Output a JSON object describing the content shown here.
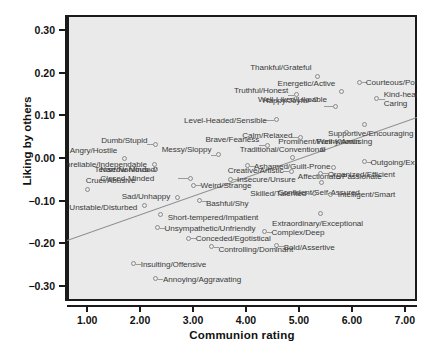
{
  "chart_data": {
    "type": "scatter",
    "title": "",
    "xlabel": "Communion rating",
    "ylabel": "Liking by others",
    "xlim": [
      0.62,
      7.23
    ],
    "ylim": [
      -0.335,
      0.335
    ],
    "xticks": [
      "1.00",
      "2.00",
      "3.00",
      "4.00",
      "5.00",
      "6.00",
      "7.00"
    ],
    "xtick_values": [
      1.0,
      2.0,
      3.0,
      4.0,
      5.0,
      6.0,
      7.0
    ],
    "yticks": [
      "0.30",
      "0.20",
      "0.10",
      "0.00",
      "−0.10",
      "−0.20",
      "−0.30"
    ],
    "ytick_values": [
      0.3,
      0.2,
      0.1,
      0.0,
      -0.1,
      -0.2,
      -0.3
    ],
    "grid": false,
    "legend": null,
    "panel_background": "#eaeaea",
    "marker_color": "#8a8a8a",
    "trendline": {
      "visible": true,
      "color": "#8d8d8d",
      "x_start": 0.62,
      "y_start": -0.193,
      "x_end": 7.23,
      "y_end": 0.095
    },
    "points": [
      {
        "label": "Thankful/Grateful",
        "x": 5.35,
        "y": 0.191
      },
      {
        "label": "Courteous/Polite",
        "x": 6.15,
        "y": 0.178
      },
      {
        "label": "Energetic/Active",
        "x": 5.8,
        "y": 0.155
      },
      {
        "label": "Truthful/Honest",
        "x": 4.95,
        "y": 0.148
      },
      {
        "label": "Kind-hearted/Caring",
        "x": 6.47,
        "y": 0.139
      },
      {
        "label": "Happy/Joyful",
        "x": 5.32,
        "y": 0.137
      },
      {
        "label": "Well-Liked/Likeable",
        "x": 5.7,
        "y": 0.121
      },
      {
        "label": "Level-Headed/Sensible",
        "x": 4.58,
        "y": 0.09
      },
      {
        "label": "Supportive/Encouraging",
        "x": 6.23,
        "y": 0.078
      },
      {
        "label": "Funny/Amusing",
        "x": 5.9,
        "y": 0.06
      },
      {
        "label": "Calm/Relaxed",
        "x": 5.03,
        "y": 0.049
      },
      {
        "label": "Dumb/Stupid",
        "x": 2.29,
        "y": 0.032
      },
      {
        "label": "Brave/Fearless",
        "x": 4.4,
        "y": 0.03
      },
      {
        "label": "Prominent/Well-Known",
        "x": 5.44,
        "y": 0.021
      },
      {
        "label": "Messy/Sloppy",
        "x": 3.48,
        "y": 0.008
      },
      {
        "label": "Traditional/Conventional",
        "x": 4.88,
        "y": 0.002
      },
      {
        "label": "Angry/Hostile",
        "x": 1.7,
        "y": -0.001
      },
      {
        "label": "Outgoing/Extraverted",
        "x": 6.24,
        "y": -0.009
      },
      {
        "label": "Unreliable/Independable",
        "x": 2.28,
        "y": -0.016
      },
      {
        "label": "Ashamed/Guilt-Prone",
        "x": 4.02,
        "y": -0.018
      },
      {
        "label": "Affectionate/Passionate",
        "x": 5.66,
        "y": -0.022
      },
      {
        "label": "Tense/Nervous",
        "x": 2.3,
        "y": -0.028
      },
      {
        "label": "Creative/Artistic",
        "x": 4.86,
        "y": -0.031
      },
      {
        "label": "Organized/Efficient",
        "x": 5.41,
        "y": -0.036
      },
      {
        "label": "Narrow-Minded/Closed-Minded",
        "x": 2.95,
        "y": -0.047
      },
      {
        "label": "Insecure/Unsure",
        "x": 3.7,
        "y": -0.05
      },
      {
        "label": "Confident/Self-Assured",
        "x": 5.43,
        "y": -0.058
      },
      {
        "label": "Weird/Strange",
        "x": 3.01,
        "y": -0.064
      },
      {
        "label": "Cruel/Abusive",
        "x": 1.01,
        "y": -0.073
      },
      {
        "label": "Skilled/Talented",
        "x": 5.29,
        "y": -0.083
      },
      {
        "label": "Intelligent/Smart",
        "x": 5.6,
        "y": -0.085
      },
      {
        "label": "Sad/Unhappy",
        "x": 2.7,
        "y": -0.092
      },
      {
        "label": "Bashful/Shy",
        "x": 3.13,
        "y": -0.1
      },
      {
        "label": "Unstable/Disturbed",
        "x": 2.08,
        "y": -0.112
      },
      {
        "label": "Extraordinary/Exceptional",
        "x": 5.4,
        "y": -0.13
      },
      {
        "label": "Short-tempered/Impatient",
        "x": 2.39,
        "y": -0.133
      },
      {
        "label": "Unsympathetic/Unfriendly",
        "x": 2.33,
        "y": -0.163
      },
      {
        "label": "Complex/Deep",
        "x": 4.35,
        "y": -0.173
      },
      {
        "label": "Conceded/Egotistical",
        "x": 2.92,
        "y": -0.188
      },
      {
        "label": "Bold/Assertive",
        "x": 4.58,
        "y": -0.205
      },
      {
        "label": "Controlling/Dominant",
        "x": 3.35,
        "y": -0.208
      },
      {
        "label": "Insulting/Offensive",
        "x": 1.88,
        "y": -0.248
      },
      {
        "label": "Annoying/Aggravating",
        "x": 2.3,
        "y": -0.283
      }
    ],
    "label_placements": [
      {
        "label": "Thankful/Grateful",
        "side": "r",
        "dx": -6,
        "dy": -9,
        "lead": false
      },
      {
        "label": "Courteous/Polite",
        "side": "l",
        "dx": 6,
        "dy": 0,
        "lead": true,
        "len": 5
      },
      {
        "label": "Energetic/Active",
        "side": "r",
        "dx": -6,
        "dy": -9,
        "lead": false
      },
      {
        "label": "Truthful/Honest",
        "side": "r",
        "dx": -8,
        "dy": -5,
        "lead": true,
        "len": 6
      },
      {
        "label": "Kind-hearted/Caring",
        "side": "l",
        "dx": 7,
        "dy": 0,
        "lead": true,
        "len": 6,
        "two": true
      },
      {
        "label": "Happy/Joyful",
        "side": "r",
        "dx": -7,
        "dy": 0,
        "lead": true,
        "len": 5
      },
      {
        "label": "Well-Liked/Likeable",
        "side": "r",
        "dx": -9,
        "dy": -7,
        "lead": true,
        "len": 9
      },
      {
        "label": "Level-Headed/Sensible",
        "side": "r",
        "dx": -10,
        "dy": 0,
        "lead": true,
        "len": 10
      },
      {
        "label": "Supportive/Encouraging",
        "side": "l",
        "dx": -36,
        "dy": 8,
        "lead": false
      },
      {
        "label": "Funny/Amusing",
        "side": "l",
        "dx": -30,
        "dy": 9,
        "lead": false
      },
      {
        "label": "Calm/Relaxed",
        "side": "r",
        "dx": -8,
        "dy": -2,
        "lead": true,
        "len": 6
      },
      {
        "label": "Dumb/Stupid",
        "side": "r",
        "dx": -8,
        "dy": -4,
        "lead": true,
        "len": 6
      },
      {
        "label": "Brave/Fearless",
        "side": "r",
        "dx": -8,
        "dy": -6,
        "lead": true,
        "len": 6
      },
      {
        "label": "Prominent/Well-Known",
        "side": "l",
        "dx": -44,
        "dy": -8,
        "lead": false
      },
      {
        "label": "Messy/Sloppy",
        "side": "r",
        "dx": -7,
        "dy": -6,
        "lead": true,
        "len": 5
      },
      {
        "label": "Traditional/Conventional",
        "side": "c",
        "dx": -10,
        "dy": -8,
        "lead": false
      },
      {
        "label": "Angry/Hostile",
        "side": "r",
        "dx": -7,
        "dy": -8,
        "lead": false
      },
      {
        "label": "Outgoing/Extraverted",
        "side": "l",
        "dx": 6,
        "dy": 0,
        "lead": true,
        "len": 5
      },
      {
        "label": "Unreliable/Independable",
        "side": "r",
        "dx": -8,
        "dy": -1,
        "lead": false
      },
      {
        "label": "Ashamed/Guilt-Prone",
        "side": "l",
        "dx": 7,
        "dy": 0,
        "lead": true,
        "len": 6
      },
      {
        "label": "Affectionate/Passionate",
        "side": "l",
        "dx": -36,
        "dy": 9,
        "lead": false
      },
      {
        "label": "Tense/Nervous",
        "side": "r",
        "dx": -8,
        "dy": -1,
        "lead": true,
        "len": 6
      },
      {
        "label": "Creative/Artistic",
        "side": "r",
        "dx": -8,
        "dy": -1,
        "lead": true,
        "len": 6
      },
      {
        "label": "Organized/Efficient",
        "side": "l",
        "dx": 7,
        "dy": 1,
        "lead": true,
        "len": 5
      },
      {
        "label": "Narrow-Minded/Closed-Minded",
        "side": "r",
        "dx": -12,
        "dy": -4,
        "lead": true,
        "len": 10,
        "two": true
      },
      {
        "label": "Insecure/Unsure",
        "side": "l",
        "dx": 7,
        "dy": 0,
        "lead": true,
        "len": 5
      },
      {
        "label": "Confident/Self-Assured",
        "side": "l",
        "dx": -44,
        "dy": 9,
        "lead": false
      },
      {
        "label": "Weird/Strange",
        "side": "l",
        "dx": 7,
        "dy": 0,
        "lead": true,
        "len": 5
      },
      {
        "label": "Cruel/Abusive",
        "side": "l",
        "dx": -2,
        "dy": -9,
        "lead": false
      },
      {
        "label": "Skilled/Talented",
        "side": "r",
        "dx": -8,
        "dy": 0,
        "lead": true,
        "len": 6
      },
      {
        "label": "Intelligent/Smart",
        "side": "l",
        "dx": 7,
        "dy": 0,
        "lead": true,
        "len": 5
      },
      {
        "label": "Sad/Unhappy",
        "side": "r",
        "dx": -7,
        "dy": -1,
        "lead": false
      },
      {
        "label": "Bashful/Shy",
        "side": "l",
        "dx": 6,
        "dy": 2,
        "lead": true,
        "len": 5
      },
      {
        "label": "Unstable/Disturbed",
        "side": "r",
        "dx": -7,
        "dy": 1,
        "lead": false
      },
      {
        "label": "Extraordinary/Exceptional",
        "side": "l",
        "dx": -48,
        "dy": 10,
        "lead": false
      },
      {
        "label": "Short-tempered/Impatient",
        "side": "l",
        "dx": 7,
        "dy": 2,
        "lead": false
      },
      {
        "label": "Unsympathetic/Unfriendly",
        "side": "l",
        "dx": 7,
        "dy": 0,
        "lead": true,
        "len": 5
      },
      {
        "label": "Complex/Deep",
        "side": "l",
        "dx": 7,
        "dy": 0,
        "lead": true,
        "len": 5
      },
      {
        "label": "Conceded/Egotistical",
        "side": "l",
        "dx": 7,
        "dy": 0,
        "lead": true,
        "len": 5
      },
      {
        "label": "Bold/Assertive",
        "side": "l",
        "dx": 7,
        "dy": 1,
        "lead": true,
        "len": 5
      },
      {
        "label": "Controlling/Dominant",
        "side": "l",
        "dx": 7,
        "dy": 2,
        "lead": true,
        "len": 5
      },
      {
        "label": "Insulting/Offensive",
        "side": "l",
        "dx": 7,
        "dy": 0,
        "lead": true,
        "len": 5
      },
      {
        "label": "Annoying/Aggravating",
        "side": "l",
        "dx": 7,
        "dy": 0,
        "lead": true,
        "len": 5
      }
    ]
  }
}
